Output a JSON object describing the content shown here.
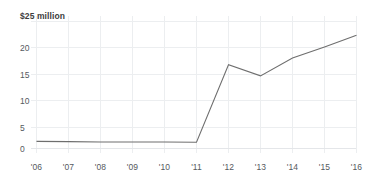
{
  "chart_data": {
    "type": "line",
    "title": "",
    "subtitle": "",
    "xlabel": "",
    "ylabel": "",
    "unit_label": "$25 million",
    "categories": [
      "'06",
      "'07",
      "'08",
      "'09",
      "'10",
      "'11",
      "'12",
      "'13",
      "'14",
      "'15",
      "'16"
    ],
    "x": [
      2006,
      2007,
      2008,
      2009,
      2010,
      2011,
      2012,
      2013,
      2014,
      2015,
      2016
    ],
    "series": [
      {
        "name": "value",
        "values": [
          1.4,
          1.35,
          1.3,
          1.3,
          1.3,
          1.25,
          16.5,
          14.3,
          17.8,
          20.0,
          22.3
        ]
      }
    ],
    "values": [
      1.4,
      1.35,
      1.3,
      1.3,
      1.3,
      1.25,
      16.5,
      14.3,
      17.8,
      20.0,
      22.3
    ],
    "ylim": [
      0,
      25
    ],
    "xlim": [
      2006,
      2016
    ],
    "y_ticks": [
      0,
      5,
      10,
      15,
      20,
      25
    ],
    "y_tick_labels": [
      "0",
      "5",
      "10",
      "15",
      "20",
      "$25 million"
    ],
    "grid": true,
    "grid_axes": "both",
    "legend": false,
    "legend_position": "none",
    "colors": {
      "line": "#6e6e6e",
      "grid": "#eceef0",
      "text": "#55595e",
      "label_bold": "#3d3d3d",
      "background": "#ffffff"
    }
  },
  "axis": {
    "y_labels": [
      {
        "text": "$25 million",
        "value": 25
      },
      {
        "text": "20",
        "value": 20
      },
      {
        "text": "15",
        "value": 15
      },
      {
        "text": "10",
        "value": 10
      },
      {
        "text": "5",
        "value": 5
      },
      {
        "text": "0",
        "value": 0
      }
    ],
    "x_labels": [
      {
        "text": "'06"
      },
      {
        "text": "'07"
      },
      {
        "text": "'08"
      },
      {
        "text": "'09"
      },
      {
        "text": "'10"
      },
      {
        "text": "'11"
      },
      {
        "text": "'12"
      },
      {
        "text": "'13"
      },
      {
        "text": "'14"
      },
      {
        "text": "'15"
      },
      {
        "text": "'16"
      }
    ]
  }
}
